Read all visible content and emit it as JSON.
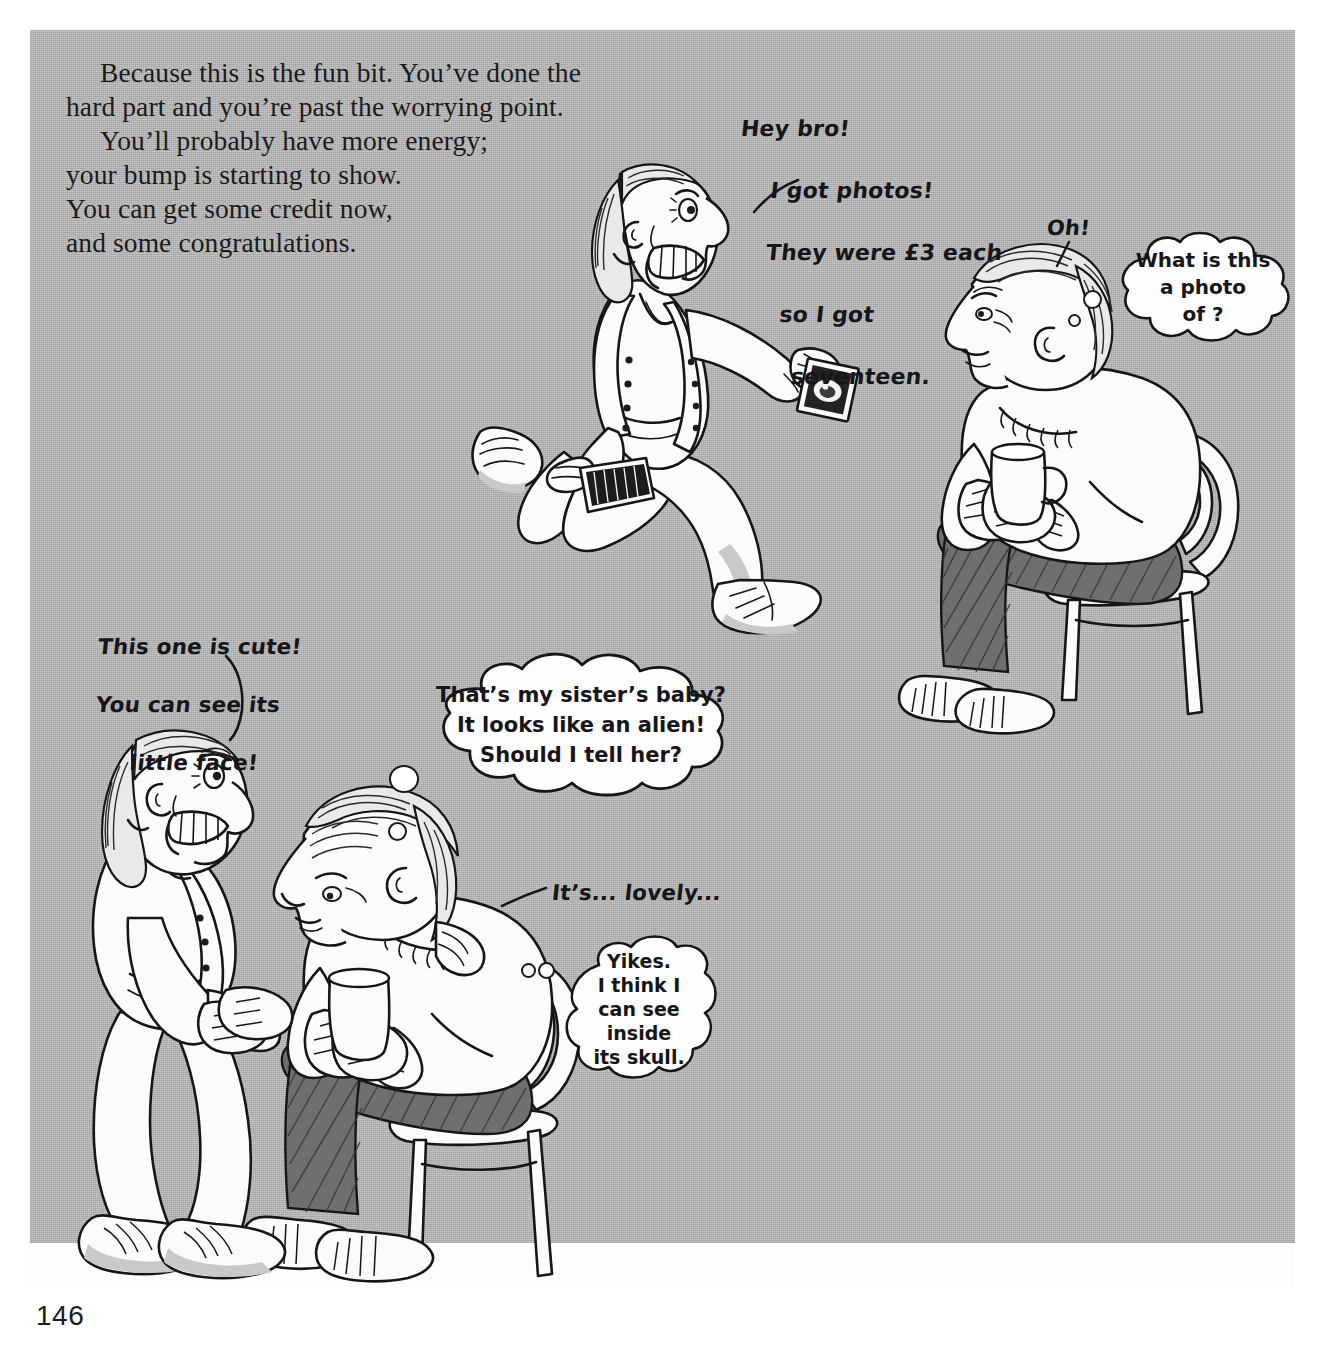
{
  "page": {
    "folio": "146",
    "background_color": "#b4b4b4",
    "ink_color": "#16161a"
  },
  "body_text": {
    "paragraphs": [
      "Because this is the fun bit. You’ve done the hard part and you’re past the worrying point.",
      "You’ll probably have more energy; your bump is starting to show. You can get some credit now, and some congratulations."
    ],
    "lines": [
      "Because this is the fun bit. You’ve done the",
      "hard part and you’re past the worrying point.",
      "You’ll probably have more energy;",
      "your bump is starting to show.",
      "You can get some credit now,",
      "and some congratulations."
    ]
  },
  "panels": [
    {
      "name": "top-scene",
      "characters": [
        {
          "name": "running-pregnant-woman",
          "description": "smiling pregnant woman running, holding a fan of ultrasound photos in one hand and waving a scan photo in the other"
        },
        {
          "name": "seated-man-with-mug",
          "description": "man sitting on a bentwood chair holding a mug of tea"
        }
      ]
    },
    {
      "name": "bottom-scene",
      "characters": [
        {
          "name": "standing-pregnant-woman",
          "description": "pregnant woman leaning over, showing a scan photo"
        },
        {
          "name": "seated-man-with-mug-2",
          "description": "man on chair holding a mug, looking at the scan photo"
        }
      ]
    }
  ],
  "speech": {
    "hey_bro": {
      "speaker": "running-pregnant-woman",
      "lines": [
        "Hey bro!",
        "I got photos!",
        "They were £3 each",
        "so I got",
        "seventeen."
      ],
      "full": "Hey bro! I got photos! They were £3 each so I got seventeen."
    },
    "oh": {
      "speaker": "seated-man-with-mug",
      "text": "Oh!"
    },
    "its_lovely": {
      "speaker": "seated-man-with-mug-2",
      "text": "It’s... lovely..."
    },
    "this_one_is_cute": {
      "speaker": "standing-pregnant-woman",
      "lines": [
        "This one is cute!",
        "You can see its",
        "little face!"
      ],
      "full": "This one is cute! You can see its little face!"
    }
  },
  "thoughts": {
    "what_is_this": {
      "thinker": "seated-man-with-mug",
      "lines": [
        "What is this",
        "a photo",
        "of ?"
      ],
      "full": "What is this a photo of ?"
    },
    "sisters_baby": {
      "thinker": "seated-man-with-mug",
      "lines": [
        "That’s my sister’s baby?",
        "It looks like an alien!",
        "Should I tell her?"
      ],
      "full": "That’s my sister’s baby? It looks like an alien! Should I tell her?"
    },
    "yikes_skull": {
      "thinker": "seated-man-with-mug-2",
      "lines": [
        "Yikes.",
        "I think I",
        "can see",
        "inside",
        "its skull."
      ],
      "full": "Yikes. I think I can see inside its skull."
    }
  }
}
